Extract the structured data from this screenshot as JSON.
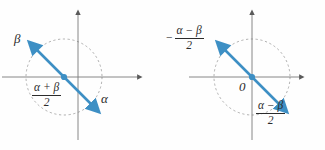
{
  "figure": {
    "background_color": "#fefefe",
    "axis_color": "#7a7a7a",
    "circle_color": "#9a9a9a",
    "vector_color": "#3d8fc4",
    "text_color": "#2b2b2b"
  },
  "diagrams": [
    {
      "id": "left",
      "center_label": "0",
      "show_center_label": false,
      "circle": {
        "cx": 64,
        "cy": 77,
        "r": 38,
        "style": "dashed"
      },
      "axes": {
        "x_axis": {
          "y": 77,
          "x_start": 2,
          "x_end": 143,
          "arrow": "right"
        },
        "y_axis": {
          "x": 78,
          "y_start": 140,
          "y_end": 10,
          "arrow": "up"
        }
      },
      "line": {
        "from_x": 34,
        "from_y": 47,
        "to_x": 94,
        "to_y": 107,
        "arrow_both_ends": true
      },
      "labels": [
        {
          "name": "beta-label",
          "text": "β",
          "kind": "greek",
          "x": 14,
          "y": 38
        },
        {
          "name": "alpha-label",
          "text": "α",
          "kind": "greek",
          "x": 101,
          "y": 98
        },
        {
          "name": "half-sum-label",
          "kind": "fraction",
          "numerator": "α + β",
          "denominator": "2",
          "sign": "",
          "x": 32,
          "y": 84
        }
      ]
    },
    {
      "id": "right",
      "center_label": "0",
      "show_center_label": true,
      "circle": {
        "cx": 89,
        "cy": 77,
        "r": 38,
        "style": "dashed"
      },
      "axes": {
        "x_axis": {
          "y": 77,
          "x_start": 2,
          "x_end": 142,
          "arrow": "right"
        },
        "y_axis": {
          "x": 89,
          "y_start": 140,
          "y_end": 10,
          "arrow": "up"
        }
      },
      "line": {
        "from_x": 59,
        "from_y": 47,
        "to_x": 119,
        "to_y": 107,
        "arrow_both_ends": true
      },
      "labels": [
        {
          "name": "negative-half-difference-label",
          "kind": "fraction",
          "numerator": "α − β",
          "denominator": "2",
          "sign": "−",
          "x": 5,
          "y": 30
        },
        {
          "name": "half-difference-label",
          "kind": "fraction",
          "numerator": "α − β",
          "denominator": "2",
          "sign": "",
          "x": 93,
          "y": 104
        }
      ],
      "origin_label": {
        "text": "0",
        "x": 76,
        "y": 82
      }
    }
  ]
}
